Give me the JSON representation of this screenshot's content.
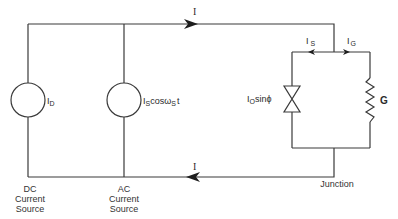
{
  "diagram": {
    "type": "circuit",
    "current_labels": {
      "top_wire": "I",
      "bottom_wire": "I",
      "left_branch": "I",
      "left_branch_sub": "S",
      "right_branch": "I",
      "right_branch_sub": "G"
    },
    "dc_source": {
      "symbol_label": "I",
      "symbol_sub": "D",
      "caption_line1": "DC",
      "caption_line2": "Current",
      "caption_line3": "Source"
    },
    "ac_source": {
      "symbol_label_pre": "I",
      "symbol_sub1": "S",
      "symbol_label_mid": "cosω",
      "symbol_sub2": "S",
      "symbol_label_post": "t",
      "caption_line1": "AC",
      "caption_line2": "Current",
      "caption_line3": "Source"
    },
    "junction": {
      "josephson_label_pre": "I",
      "josephson_sub": "O",
      "josephson_label_post": "sinϕ",
      "conductance_label": "G",
      "caption": "Junction"
    },
    "colors": {
      "wire": "#3a3a3a",
      "text": "#2a2a2a",
      "background": "#ffffff"
    }
  }
}
